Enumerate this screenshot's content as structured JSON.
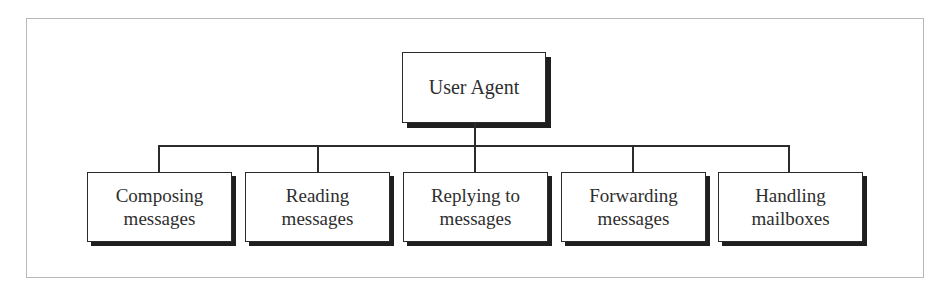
{
  "diagram": {
    "type": "hierarchy-tree",
    "root": {
      "label": "User Agent"
    },
    "children": [
      {
        "line1": "Composing",
        "line2": "messages",
        "label": "Composing messages"
      },
      {
        "line1": "Reading",
        "line2": "messages",
        "label": "Reading messages"
      },
      {
        "line1": "Replying to",
        "line2": "messages",
        "label": "Replying to messages"
      },
      {
        "line1": "Forwarding",
        "line2": "messages",
        "label": "Forwarding messages"
      },
      {
        "line1": "Handling",
        "line2": "mailboxes",
        "label": "Handling mailboxes"
      }
    ],
    "edges": [
      {
        "from": "User Agent",
        "to": "Composing messages"
      },
      {
        "from": "User Agent",
        "to": "Reading messages"
      },
      {
        "from": "User Agent",
        "to": "Replying to messages"
      },
      {
        "from": "User Agent",
        "to": "Forwarding messages"
      },
      {
        "from": "User Agent",
        "to": "Handling mailboxes"
      }
    ],
    "colors": {
      "frame_border": "#b8b8b8",
      "box_border": "#2b2b2b",
      "shadow": "#1f1f1f",
      "text": "#2e2e2e",
      "background": "#ffffff"
    }
  }
}
